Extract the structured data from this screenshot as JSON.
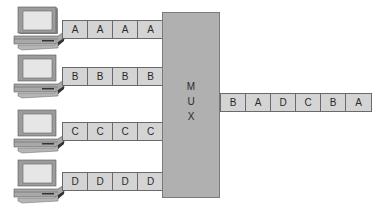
{
  "diagram": {
    "title": "",
    "mux": {
      "label_letters": [
        "M",
        "U",
        "X"
      ]
    },
    "inputs": [
      {
        "source": "computer-a",
        "cells": [
          "A",
          "A",
          "A",
          "A"
        ]
      },
      {
        "source": "computer-b",
        "cells": [
          "B",
          "B",
          "B",
          "B"
        ]
      },
      {
        "source": "computer-c",
        "cells": [
          "C",
          "C",
          "C",
          "C"
        ]
      },
      {
        "source": "computer-d",
        "cells": [
          "D",
          "D",
          "D",
          "D"
        ]
      }
    ],
    "output": {
      "cells": [
        "B",
        "A",
        "D",
        "C",
        "B",
        "A"
      ]
    },
    "colors": {
      "cell_fill": "#d4d4d4",
      "mux_fill": "#b0b0b0",
      "border": "#6a6a6a"
    }
  }
}
